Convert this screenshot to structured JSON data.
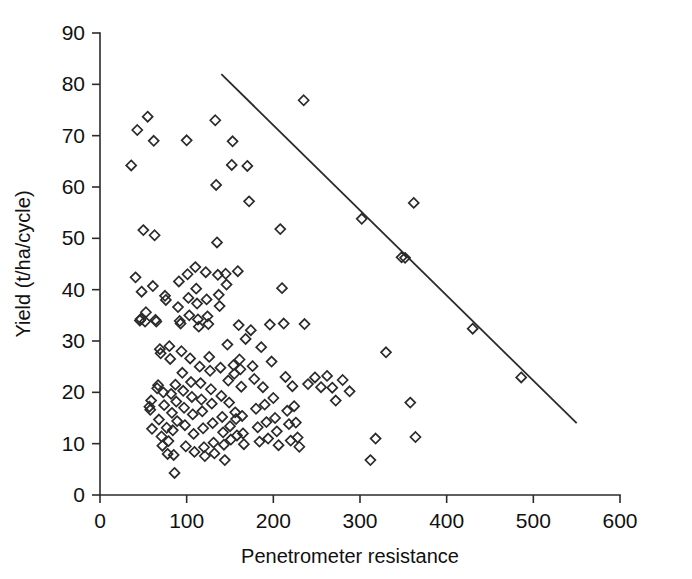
{
  "figure": {
    "background_color": "#ffffff",
    "ink_color": "#2b2b2b",
    "width": 692,
    "height": 579
  },
  "chart_data": {
    "type": "scatter",
    "title": "",
    "subtitle": "",
    "xlabel": "Penetrometer resistance",
    "ylabel": "Yield (t/ha/cycle)",
    "xlim": [
      0,
      600
    ],
    "ylim": [
      0,
      90
    ],
    "xticks": [
      0,
      100,
      200,
      300,
      400,
      500,
      600
    ],
    "yticks": [
      0,
      10,
      20,
      30,
      40,
      50,
      60,
      70,
      80,
      90
    ],
    "xtick_labels": [
      "0",
      "100",
      "200",
      "300",
      "400",
      "500",
      "600"
    ],
    "ytick_labels": [
      "0",
      "10",
      "20",
      "30",
      "40",
      "50",
      "60",
      "70",
      "80",
      "90"
    ],
    "grid": false,
    "legend": null,
    "legend_position": "none",
    "marker_style": "open-diamond",
    "marker_size_px": 10,
    "series": [
      {
        "name": "observations",
        "marker": "open-diamond",
        "points": [
          [
            36,
            64.2
          ],
          [
            41,
            42.4
          ],
          [
            43,
            71.1
          ],
          [
            46,
            34.0
          ],
          [
            47,
            34.3
          ],
          [
            48,
            39.6
          ],
          [
            50,
            51.6
          ],
          [
            52,
            33.8
          ],
          [
            53,
            35.6
          ],
          [
            55,
            73.7
          ],
          [
            57,
            17.2
          ],
          [
            58,
            16.6
          ],
          [
            59,
            18.4
          ],
          [
            60,
            12.9
          ],
          [
            61,
            40.7
          ],
          [
            62,
            69.0
          ],
          [
            63,
            50.6
          ],
          [
            64,
            34.1
          ],
          [
            65,
            33.8
          ],
          [
            66,
            20.8
          ],
          [
            67,
            21.4
          ],
          [
            68,
            14.7
          ],
          [
            69,
            28.4
          ],
          [
            70,
            27.6
          ],
          [
            71,
            11.4
          ],
          [
            72,
            9.6
          ],
          [
            73,
            20.0
          ],
          [
            74,
            17.5
          ],
          [
            75,
            38.8
          ],
          [
            76,
            38.0
          ],
          [
            77,
            13.1
          ],
          [
            78,
            8.0
          ],
          [
            79,
            10.5
          ],
          [
            80,
            29.0
          ],
          [
            81,
            26.5
          ],
          [
            82,
            19.7
          ],
          [
            83,
            16.0
          ],
          [
            84,
            12.6
          ],
          [
            85,
            7.8
          ],
          [
            86,
            4.3
          ],
          [
            87,
            21.5
          ],
          [
            88,
            18.2
          ],
          [
            89,
            14.4
          ],
          [
            90,
            36.6
          ],
          [
            91,
            41.6
          ],
          [
            92,
            33.9
          ],
          [
            93,
            33.4
          ],
          [
            94,
            28.0
          ],
          [
            95,
            23.8
          ],
          [
            96,
            20.3
          ],
          [
            97,
            17.0
          ],
          [
            98,
            13.6
          ],
          [
            99,
            9.5
          ],
          [
            100,
            69.1
          ],
          [
            101,
            43.0
          ],
          [
            102,
            38.4
          ],
          [
            103,
            35.0
          ],
          [
            104,
            26.6
          ],
          [
            105,
            22.0
          ],
          [
            106,
            19.1
          ],
          [
            107,
            15.7
          ],
          [
            108,
            11.9
          ],
          [
            109,
            8.4
          ],
          [
            110,
            44.4
          ],
          [
            111,
            40.2
          ],
          [
            112,
            37.3
          ],
          [
            113,
            34.2
          ],
          [
            114,
            32.8
          ],
          [
            115,
            25.0
          ],
          [
            116,
            21.8
          ],
          [
            117,
            18.6
          ],
          [
            118,
            16.3
          ],
          [
            119,
            13.0
          ],
          [
            120,
            9.3
          ],
          [
            121,
            7.6
          ],
          [
            122,
            43.4
          ],
          [
            123,
            38.1
          ],
          [
            124,
            34.8
          ],
          [
            125,
            33.3
          ],
          [
            126,
            26.9
          ],
          [
            127,
            24.2
          ],
          [
            128,
            20.6
          ],
          [
            129,
            17.8
          ],
          [
            130,
            14.0
          ],
          [
            131,
            10.2
          ],
          [
            132,
            8.1
          ],
          [
            133,
            73.0
          ],
          [
            134,
            60.4
          ],
          [
            135,
            49.2
          ],
          [
            136,
            42.9
          ],
          [
            137,
            39.0
          ],
          [
            138,
            36.8
          ],
          [
            139,
            24.8
          ],
          [
            140,
            19.3
          ],
          [
            141,
            15.2
          ],
          [
            142,
            12.2
          ],
          [
            143,
            9.8
          ],
          [
            144,
            6.8
          ],
          [
            145,
            43.1
          ],
          [
            146,
            41.0
          ],
          [
            147,
            29.3
          ],
          [
            148,
            22.3
          ],
          [
            149,
            18.0
          ],
          [
            150,
            13.4
          ],
          [
            151,
            10.8
          ],
          [
            152,
            64.3
          ],
          [
            153,
            68.9
          ],
          [
            154,
            25.3
          ],
          [
            155,
            23.6
          ],
          [
            156,
            16.1
          ],
          [
            157,
            14.8
          ],
          [
            158,
            11.6
          ],
          [
            159,
            43.6
          ],
          [
            160,
            33.1
          ],
          [
            161,
            26.4
          ],
          [
            162,
            24.5
          ],
          [
            163,
            21.1
          ],
          [
            164,
            15.4
          ],
          [
            165,
            12.0
          ],
          [
            166,
            9.9
          ],
          [
            168,
            30.4
          ],
          [
            170,
            64.1
          ],
          [
            172,
            57.2
          ],
          [
            174,
            32.1
          ],
          [
            176,
            25.1
          ],
          [
            178,
            22.6
          ],
          [
            180,
            16.8
          ],
          [
            182,
            13.2
          ],
          [
            184,
            10.4
          ],
          [
            186,
            28.8
          ],
          [
            188,
            21.0
          ],
          [
            190,
            17.6
          ],
          [
            192,
            14.2
          ],
          [
            194,
            11.0
          ],
          [
            196,
            33.2
          ],
          [
            198,
            26.0
          ],
          [
            200,
            18.9
          ],
          [
            202,
            15.0
          ],
          [
            204,
            12.4
          ],
          [
            206,
            9.7
          ],
          [
            208,
            51.8
          ],
          [
            210,
            40.3
          ],
          [
            212,
            33.4
          ],
          [
            214,
            23.0
          ],
          [
            216,
            16.4
          ],
          [
            218,
            13.8
          ],
          [
            220,
            10.6
          ],
          [
            222,
            21.2
          ],
          [
            224,
            17.3
          ],
          [
            226,
            14.1
          ],
          [
            228,
            11.2
          ],
          [
            230,
            9.4
          ],
          [
            235,
            76.9
          ],
          [
            236,
            33.3
          ],
          [
            240,
            21.6
          ],
          [
            248,
            22.9
          ],
          [
            255,
            21.0
          ],
          [
            262,
            23.2
          ],
          [
            268,
            20.9
          ],
          [
            272,
            18.4
          ],
          [
            280,
            22.4
          ],
          [
            288,
            20.2
          ],
          [
            302,
            53.8
          ],
          [
            312,
            6.8
          ],
          [
            318,
            11.0
          ],
          [
            330,
            27.8
          ],
          [
            348,
            46.3
          ],
          [
            352,
            46.2
          ],
          [
            358,
            18.0
          ],
          [
            362,
            56.9
          ],
          [
            364,
            11.3
          ],
          [
            430,
            32.4
          ],
          [
            486,
            22.9
          ]
        ]
      }
    ],
    "fit_line": {
      "name": "boundary-line",
      "x_start": 140,
      "y_start": 82.0,
      "x_end": 550,
      "y_end": 14.0
    }
  }
}
